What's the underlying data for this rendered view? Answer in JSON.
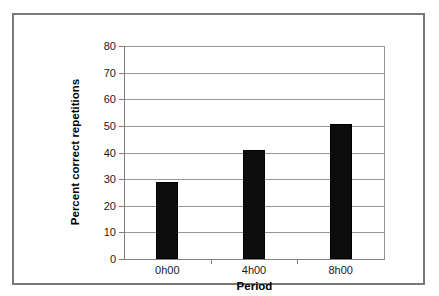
{
  "chart_data": {
    "type": "bar",
    "title": "",
    "subtitle": "",
    "xlabel": "Period",
    "ylabel": "Percent correct repetitions",
    "categories": [
      "0h00",
      "4h00",
      "8h00"
    ],
    "values": [
      28.9,
      40.9,
      50.7
    ],
    "ylim": [
      0,
      80
    ],
    "ytick_step": 10,
    "yticks": [
      "80",
      "70",
      "60",
      "50",
      "40",
      "30",
      "20",
      "10",
      "0"
    ],
    "ytick_values": [
      80,
      70,
      60,
      50,
      40,
      30,
      20,
      10,
      0
    ],
    "grid": true,
    "grid_axis": "y",
    "legend": false,
    "legend_position": "none",
    "bar_color": "#0d0d0d",
    "grid_color": "#969696",
    "axis_color": "#808080",
    "frame_color": "#7a7a7a",
    "background_color": "#ffffff"
  },
  "axis": {
    "y_title": "Percent correct repetitions",
    "x_title": "Period"
  }
}
